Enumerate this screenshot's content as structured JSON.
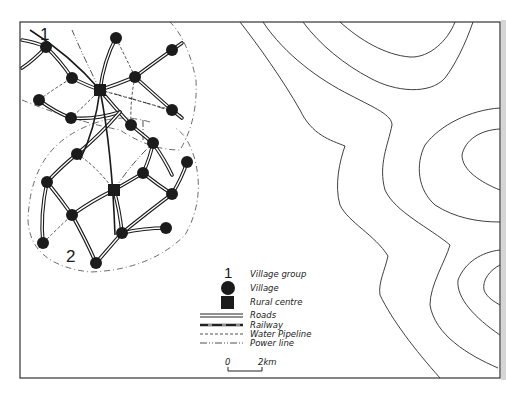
{
  "map": {
    "frame": {
      "x": 20,
      "y": 22,
      "w": 480,
      "h": 356
    },
    "group_labels": [
      {
        "text": "1",
        "x": 40,
        "y": 40
      },
      {
        "text": "2",
        "x": 66,
        "y": 262
      }
    ],
    "rural_centres": [
      {
        "name": "rural-centre-1",
        "x": 100,
        "y": 90
      },
      {
        "name": "rural-centre-2",
        "x": 114,
        "y": 190
      }
    ],
    "villages": [
      {
        "x": 46,
        "y": 47
      },
      {
        "x": 116,
        "y": 38
      },
      {
        "x": 172,
        "y": 50
      },
      {
        "x": 72,
        "y": 78
      },
      {
        "x": 135,
        "y": 77
      },
      {
        "x": 39,
        "y": 100
      },
      {
        "x": 71,
        "y": 118
      },
      {
        "x": 172,
        "y": 110
      },
      {
        "x": 131,
        "y": 125
      },
      {
        "x": 153,
        "y": 143
      },
      {
        "x": 77,
        "y": 154
      },
      {
        "x": 47,
        "y": 182
      },
      {
        "x": 143,
        "y": 173
      },
      {
        "x": 187,
        "y": 162
      },
      {
        "x": 172,
        "y": 194
      },
      {
        "x": 72,
        "y": 215
      },
      {
        "x": 166,
        "y": 228
      },
      {
        "x": 122,
        "y": 233
      },
      {
        "x": 43,
        "y": 243
      },
      {
        "x": 96,
        "y": 263
      }
    ],
    "roads": [
      "M22,40 Q35,42 46,47 Q60,60 72,78 Q88,86 100,90",
      "M22,68 Q34,60 46,47",
      "M100,90 Q118,84 135,77 Q155,62 172,50 L182,43",
      "M100,90 Q115,108 131,125 Q142,134 153,143 Q165,160 172,175",
      "M135,77 Q155,95 172,110 L182,118",
      "M39,100 Q55,112 71,118 Q95,120 120,112",
      "M116,38 Q104,60 100,90",
      "M77,154 Q62,166 47,182 Q40,215 43,243",
      "M77,154 Q100,135 120,112",
      "M47,182 Q60,198 72,215 Q86,240 96,263",
      "M72,215 Q93,200 114,190 Q128,182 143,173 Q150,158 153,143",
      "M143,173 Q158,185 172,194 Q182,178 187,162",
      "M114,190 Q120,212 122,233 Q109,248 96,263",
      "M122,233 Q144,228 166,228",
      "M122,233 Q148,212 172,194"
    ],
    "railways": [
      "M30,30 Q70,55 100,90 Q112,150 115,235",
      "M100,90 Q95,130 80,160"
    ],
    "pipelines": [
      "M46,47 Q60,64 72,78",
      "M39,100 Q55,88 72,78",
      "M39,100 Q55,110 71,118 Q86,104 100,90",
      "M116,38 Q126,58 135,77",
      "M100,90 Q135,100 172,110",
      "M135,77 Q130,100 131,125",
      "M77,154 Q95,165 114,190",
      "M47,182 Q60,168 77,154",
      "M43,243 Q58,228 72,215",
      "M72,215 Q85,240 96,263",
      "M143,173 Q155,184 166,190"
    ],
    "powerlines": [
      "M100,90 Q140,100 182,115",
      "M100,90 Q85,60 72,30",
      "M114,190 Q130,165 153,143",
      "M143,120 L143,140"
    ],
    "boundaries": [
      "M22,100 Q70,120 120,130 Q150,150 180,150 Q198,120 196,80 Q188,40 170,22",
      "M150,122 Q110,110 70,135 Q30,160 28,220 Q30,265 90,272 Q150,270 185,235 Q205,200 195,160 Q188,135 175,128"
    ],
    "contours": [
      "M240,22 C258,45 283,80 300,110 C312,135 330,140 345,146 C340,160 334,185 340,205 C348,222 375,235 388,256 C385,270 378,283 380,295 C392,320 415,350 440,378",
      "M263,22 C285,55 320,80 350,95 C375,108 392,115 392,125 C388,145 378,165 385,190 C395,212 430,228 450,245 C445,262 430,285 430,305 C435,335 468,355 498,368",
      "M303,22 C320,45 345,65 370,78 C395,92 430,95 445,78 C455,65 465,45 473,22",
      "M340,22 C360,40 385,55 410,57 C430,58 448,40 455,22",
      "M500,108 C470,110 440,125 425,145 C415,165 418,190 435,205 C455,218 478,222 500,222",
      "M500,129 C480,130 465,140 462,155 C462,170 480,182 500,190",
      "M500,250 C482,252 465,262 458,280 C456,298 475,318 500,335",
      "M500,265 C490,270 482,280 484,290 C487,298 495,302 500,305"
    ]
  },
  "legend": {
    "group_number": "1",
    "items": [
      {
        "label": "Village group",
        "symbol": "number"
      },
      {
        "label": "Village",
        "symbol": "circle"
      },
      {
        "label": "Rural centre",
        "symbol": "square"
      },
      {
        "label": "Roads",
        "symbol": "double-line"
      },
      {
        "label": "Railway",
        "symbol": "railway"
      },
      {
        "label": "Water Pipeline",
        "symbol": "dashed"
      },
      {
        "label": "Power line",
        "symbol": "dash-dot"
      }
    ],
    "scale": {
      "start": "0",
      "end": "2km"
    }
  },
  "colors": {
    "ink": "#1b1b1b",
    "paper": "#ffffff"
  }
}
